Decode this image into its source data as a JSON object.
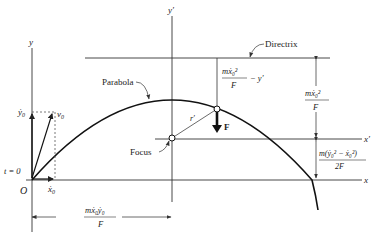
{
  "diagram": {
    "axes": {
      "y": "y",
      "y_prime": "y′",
      "x": "x",
      "x_prime": "x′",
      "origin": "O"
    },
    "labels": {
      "parabola": "Parabola",
      "directrix": "Directrix",
      "focus": "Focus",
      "force": "F",
      "r_prime": "r′",
      "t0": "t = 0",
      "v0": "v",
      "v0_sub": "0",
      "ydot0": "ẏ",
      "ydot0_sub": "0",
      "xdot0": "ẋ",
      "xdot0_sub": "0"
    },
    "dimensions": {
      "top_mid_num": "mẋ₀²",
      "top_mid_den": "F",
      "top_mid_suffix": "− y′",
      "right_upper_num": "mẋ₀²",
      "right_upper_den": "F",
      "right_lower_num": "m(ẏ₀² − ẋ₀²)",
      "right_lower_den": "2F",
      "bottom_num": "mẋ₀ẏ₀",
      "bottom_den": "F"
    },
    "colors": {
      "line": "#222222",
      "thin": "#555555",
      "background": "#ffffff"
    }
  }
}
